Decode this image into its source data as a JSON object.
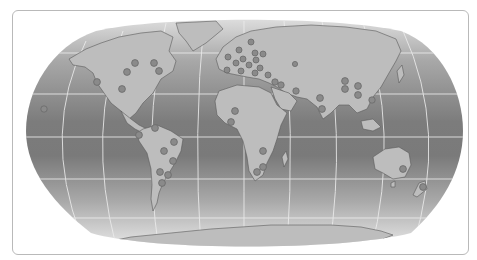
{
  "card": {
    "kind": "world-map-panel"
  },
  "map": {
    "projection": "robinson-like",
    "colors": {
      "ocean_top": "#d6d6d6",
      "ocean_mid": "#7f7f7f",
      "ocean_bottom": "#e4e4e4",
      "land": "#bdbdbd",
      "land_stroke": "#5a5a5a",
      "graticule": "#e8e8e8",
      "marker_fill": "#8a8a8a",
      "marker_stroke": "#6a6a6a",
      "border": "#b9b9b9"
    },
    "markers": [
      {
        "region": "north-america",
        "x": 134,
        "y": 62
      },
      {
        "region": "north-america",
        "x": 153,
        "y": 62
      },
      {
        "region": "north-america",
        "x": 126,
        "y": 71
      },
      {
        "region": "north-america",
        "x": 96,
        "y": 81
      },
      {
        "region": "north-america",
        "x": 121,
        "y": 88
      },
      {
        "region": "north-america",
        "x": 158,
        "y": 70
      },
      {
        "region": "pacific",
        "x": 43,
        "y": 108
      },
      {
        "region": "central-america",
        "x": 154,
        "y": 127
      },
      {
        "region": "south-america",
        "x": 138,
        "y": 134
      },
      {
        "region": "south-america",
        "x": 173,
        "y": 141
      },
      {
        "region": "south-america",
        "x": 163,
        "y": 150
      },
      {
        "region": "south-america",
        "x": 172,
        "y": 160
      },
      {
        "region": "south-america",
        "x": 159,
        "y": 171
      },
      {
        "region": "south-america",
        "x": 167,
        "y": 174
      },
      {
        "region": "south-america",
        "x": 161,
        "y": 182
      },
      {
        "region": "europe",
        "x": 250,
        "y": 41
      },
      {
        "region": "europe",
        "x": 238,
        "y": 49
      },
      {
        "region": "europe",
        "x": 254,
        "y": 52
      },
      {
        "region": "europe",
        "x": 262,
        "y": 53
      },
      {
        "region": "europe",
        "x": 227,
        "y": 56
      },
      {
        "region": "europe",
        "x": 242,
        "y": 58
      },
      {
        "region": "europe",
        "x": 255,
        "y": 59
      },
      {
        "region": "europe",
        "x": 235,
        "y": 62
      },
      {
        "region": "europe",
        "x": 248,
        "y": 64
      },
      {
        "region": "europe",
        "x": 259,
        "y": 67
      },
      {
        "region": "europe",
        "x": 226,
        "y": 69
      },
      {
        "region": "europe",
        "x": 240,
        "y": 70
      },
      {
        "region": "europe",
        "x": 254,
        "y": 72
      },
      {
        "region": "europe",
        "x": 267,
        "y": 74
      },
      {
        "region": "middle-east",
        "x": 274,
        "y": 81
      },
      {
        "region": "middle-east",
        "x": 280,
        "y": 84
      },
      {
        "region": "middle-east",
        "x": 295,
        "y": 90
      },
      {
        "region": "africa",
        "x": 234,
        "y": 110
      },
      {
        "region": "africa",
        "x": 230,
        "y": 121
      },
      {
        "region": "africa",
        "x": 262,
        "y": 150
      },
      {
        "region": "africa",
        "x": 262,
        "y": 166
      },
      {
        "region": "africa",
        "x": 256,
        "y": 171
      },
      {
        "region": "asia",
        "x": 294,
        "y": 63
      },
      {
        "region": "asia",
        "x": 344,
        "y": 80
      },
      {
        "region": "asia",
        "x": 344,
        "y": 88
      },
      {
        "region": "asia",
        "x": 357,
        "y": 85
      },
      {
        "region": "asia",
        "x": 357,
        "y": 94
      },
      {
        "region": "asia",
        "x": 319,
        "y": 97
      },
      {
        "region": "asia",
        "x": 321,
        "y": 108
      },
      {
        "region": "asia",
        "x": 371,
        "y": 99
      },
      {
        "region": "oceania",
        "x": 402,
        "y": 168
      },
      {
        "region": "oceania",
        "x": 422,
        "y": 186
      }
    ]
  }
}
